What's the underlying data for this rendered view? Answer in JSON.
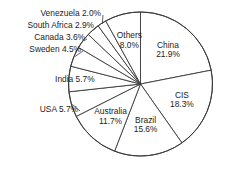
{
  "chart_data": {
    "type": "pie",
    "title": "",
    "subtitle": "",
    "xlabel": "",
    "ylabel": "",
    "legend_position": "none",
    "grid": false,
    "units": "percent",
    "start_angle_deg": 0,
    "direction": "clockwise",
    "categories": [
      "China",
      "CIS",
      "Brazil",
      "Australia",
      "USA",
      "India",
      "Sweden",
      "Canada",
      "South Africa",
      "Venezuela",
      "Others"
    ],
    "values": [
      21.9,
      18.3,
      15.6,
      11.7,
      5.7,
      5.7,
      4.5,
      3.6,
      2.9,
      2.0,
      8.0
    ],
    "slices": [
      {
        "name": "China",
        "value": 21.9,
        "label_line1": "China",
        "label_line2": "21.9%",
        "label_mode": "inside"
      },
      {
        "name": "CIS",
        "value": 18.3,
        "label_line1": "CIS",
        "label_line2": "18.3%",
        "label_mode": "inside"
      },
      {
        "name": "Brazil",
        "value": 15.6,
        "label_line1": "Brazil",
        "label_line2": "15.6%",
        "label_mode": "inside"
      },
      {
        "name": "Australia",
        "value": 11.7,
        "label_line1": "Australia",
        "label_line2": "11.7%",
        "label_mode": "inside"
      },
      {
        "name": "USA",
        "value": 5.7,
        "label_line1": "USA 5.7%",
        "label_line2": "",
        "label_mode": "outside"
      },
      {
        "name": "India",
        "value": 5.7,
        "label_line1": "India 5.7%",
        "label_line2": "",
        "label_mode": "inside"
      },
      {
        "name": "Sweden",
        "value": 4.5,
        "label_line1": "Sweden 4.5%",
        "label_line2": "",
        "label_mode": "outside"
      },
      {
        "name": "Canada",
        "value": 3.6,
        "label_line1": "Canada 3.6%",
        "label_line2": "",
        "label_mode": "outside"
      },
      {
        "name": "South Africa",
        "value": 2.9,
        "label_line1": "South Africa 2.9%",
        "label_line2": "",
        "label_mode": "outside"
      },
      {
        "name": "Venezuela",
        "value": 2.0,
        "label_line1": "Venezuela 2.0%",
        "label_line2": "",
        "label_mode": "outside"
      },
      {
        "name": "Others",
        "value": 8.0,
        "label_line1": "Others",
        "label_line2": "8.0%",
        "label_mode": "inside"
      }
    ],
    "colors": {
      "slice_fill": "#ffffff",
      "slice_stroke": "#3a3a3a",
      "text": "#1c1c1c",
      "background": "#ffffff"
    }
  },
  "labels": {
    "china_line1": "China",
    "china_line2": "21.9%",
    "cis_line1": "CIS",
    "cis_line2": "18.3%",
    "brazil_line1": "Brazil",
    "brazil_line2": "15.6%",
    "australia_line1": "Australia",
    "australia_line2": "11.7%",
    "others_line1": "Others",
    "others_line2": "8.0%",
    "india": "India 5.7%",
    "usa": "USA 5.7%",
    "sweden": "Sweden 4.5%",
    "canada": "Canada 3.6%",
    "south_africa": "South Africa 2.9%",
    "venezuela": "Venezuela 2.0%"
  }
}
